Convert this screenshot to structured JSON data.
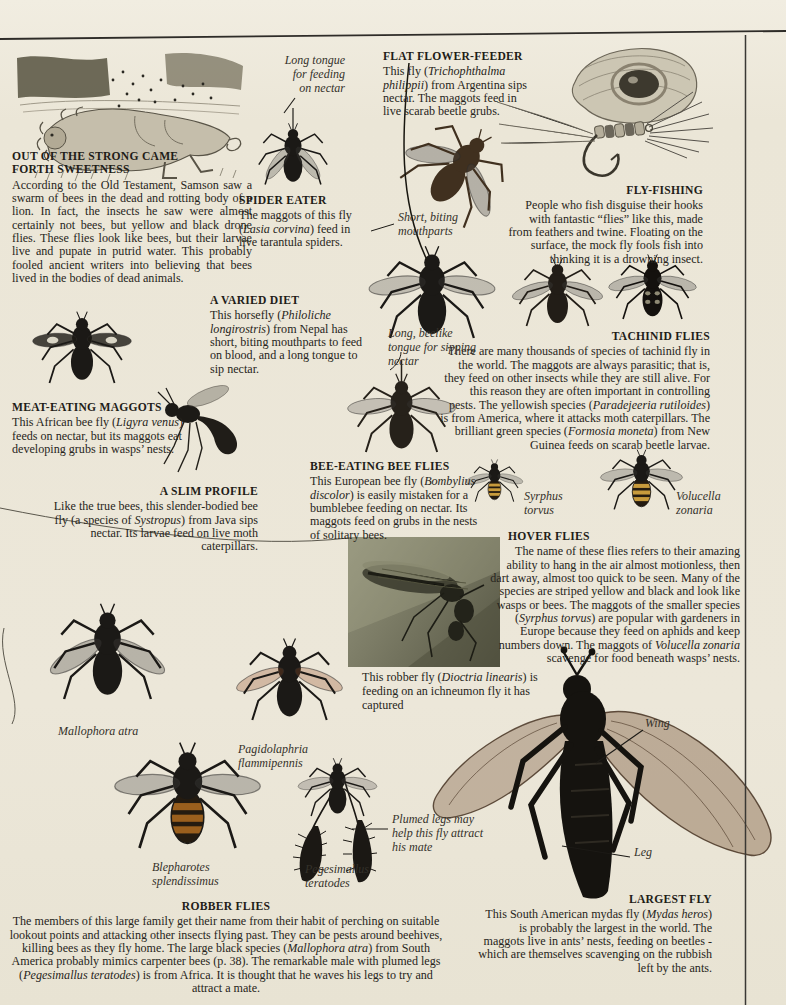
{
  "page_type": "encyclopedia page about flies",
  "colors": {
    "paper": "#ece7d9",
    "ink": "#272520",
    "rule": "#2e2c28",
    "photo_olive": "#7c7c66",
    "hoverfly_band": "#c89b3c"
  },
  "sections": {
    "samson": {
      "heading": "OUT OF THE STRONG CAME\nFORTH SWEETNESS",
      "body": "According to the Old Testament, Samson saw a swarm of bees in the dead and rotting body of a lion. In fact, the insects he saw were almost certainly not bees, but yellow and black drone flies. These flies look like bees, but their larvae live and pupate in putrid water. This probably fooled ancient writers into believing that bees lived in the bodies of dead animals."
    },
    "spider_eater": {
      "heading": "SPIDER EATER",
      "body": [
        {
          "t": "The maggots of this fly ("
        },
        {
          "t": "Lasia corvina",
          "i": true
        },
        {
          "t": ") feed in live tarantula spiders."
        }
      ]
    },
    "flat_flower_feeder": {
      "heading": "FLAT FLOWER-FEEDER",
      "body": [
        {
          "t": "This fly ("
        },
        {
          "t": "Trichophthalma philippii",
          "i": true
        },
        {
          "t": ") from Argentina sips nectar. The maggots feed in live scarab beetle grubs."
        }
      ]
    },
    "fly_fishing": {
      "heading": "FLY-FISHING",
      "body": "People who fish disguise their hooks with fantastic “flies” like this, made from feathers and twine. Floating on the surface, the mock fly fools fish into thinking it is a drowning insect."
    },
    "tachinid_flies": {
      "heading": "TACHINID FLIES",
      "body": [
        {
          "t": "There are many thousands of species of tachinid fly in the world. The maggots are always parasitic; that is, they feed on other insects while they are still alive. For this reason they are often important in controlling pests. The yellowish species ("
        },
        {
          "t": "Paradejeeria rutiloides",
          "i": true
        },
        {
          "t": ") is from America, where it attacks moth caterpillars. The brilliant green species ("
        },
        {
          "t": "Formosia moneta",
          "i": true
        },
        {
          "t": ") from New Guinea feeds on scarab beetle larvae."
        }
      ]
    },
    "varied_diet": {
      "heading": "A VARIED DIET",
      "body": [
        {
          "t": "This horsefly ("
        },
        {
          "t": "Philoliche longirostris",
          "i": true
        },
        {
          "t": ") from Nepal has short, biting mouthparts to feed on blood, and a long tongue to sip nectar."
        }
      ]
    },
    "meat_eating_maggots": {
      "heading": "MEAT-EATING MAGGOTS",
      "body": [
        {
          "t": "This African bee fly ("
        },
        {
          "t": "Ligyra venus",
          "i": true
        },
        {
          "t": ") feeds on nectar, but its maggots eat developing grubs in wasps’ nests."
        }
      ]
    },
    "slim_profile": {
      "heading": "A SLIM PROFILE",
      "body": [
        {
          "t": "Like the true bees, this slender-bodied bee fly (a species of "
        },
        {
          "t": "Systropus",
          "i": true
        },
        {
          "t": ") from Java sips nectar. Its larvae feed on live moth caterpillars."
        }
      ]
    },
    "bee_eating_bee_flies": {
      "heading": "BEE-EATING BEE FLIES",
      "body": [
        {
          "t": "This European bee fly ("
        },
        {
          "t": "Bombylius discolor",
          "i": true
        },
        {
          "t": ") is easily mistaken for a bumblebee feeding on nectar. Its maggots feed on grubs in the nests of solitary bees."
        }
      ]
    },
    "hover_flies": {
      "heading": "HOVER FLIES",
      "body": [
        {
          "t": "The name of these flies refers to their amazing ability to hang in the air almost motionless, then dart away, almost too quick to be seen. Many of the species are striped yellow and black and look like wasps or bees. The maggots of the smaller species ("
        },
        {
          "t": "Syrphus torvus",
          "i": true
        },
        {
          "t": ") are popular with gardeners in Europe because they feed on aphids and keep numbers down. The maggots of "
        },
        {
          "t": "Volucella zonaria",
          "i": true
        },
        {
          "t": " scavenge for food beneath wasps’ nests."
        }
      ]
    },
    "robber_fly_photo": {
      "caption": [
        {
          "t": "This robber fly ("
        },
        {
          "t": "Dioctria linearis",
          "i": true
        },
        {
          "t": ") is feeding on an ichneumon fly it has captured"
        }
      ]
    },
    "robber_flies": {
      "heading": "ROBBER FLIES",
      "body": [
        {
          "t": "The members of this large family get their name from their habit of perching on suitable lookout points and attacking other insects flying past. They can be pests around beehives, killing bees as they fly home. The large black species ("
        },
        {
          "t": "Mallophora atra",
          "i": true
        },
        {
          "t": ") from South America probably mimics carpenter bees (p. 38). The remarkable male with plumed legs ("
        },
        {
          "t": "Pegesimallus teratodes",
          "i": true
        },
        {
          "t": ") is from Africa. It is thought that he waves his legs to try and attract a mate."
        }
      ]
    },
    "largest_fly": {
      "heading": "LARGEST FLY",
      "body": [
        {
          "t": "This South American mydas fly ("
        },
        {
          "t": "Mydas heros",
          "i": true
        },
        {
          "t": ") is probably the largest in the world. The maggots live in ants’ nests, feeding on beetles - which are themselves scavenging on the rubbish left by the ants."
        }
      ]
    }
  },
  "labels": {
    "long_tongue": "Long tongue\nfor feeding\non nectar",
    "short_mouthparts": "Short, biting\nmouthparts",
    "beelike_tongue": "Long, beelike\ntongue for sipping\nnectar",
    "syrphus": "Syrphus\ntorvus",
    "volucella": "Volucella\nzonaria",
    "mallophora": "Mallophora atra",
    "pagidolaphria": "Pagidolaphria\nflammipennis",
    "blepharotes": "Blepharotes\nsplendissimus",
    "pegesimallus": "Pegesimallus\nteratodes",
    "plumed_legs": "Plumed legs may\nhelp this fly attract\nhis mate",
    "wing": "Wing",
    "leg": "Leg"
  }
}
